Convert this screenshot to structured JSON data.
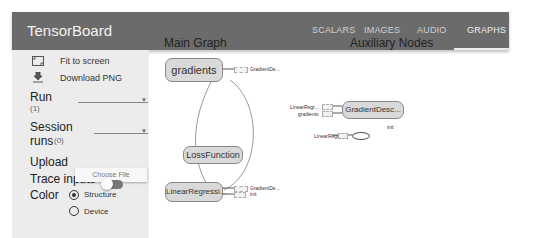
{
  "header": {
    "title": "TensorBoard",
    "tabs": [
      {
        "label": "SCALARS",
        "active": false
      },
      {
        "label": "IMAGES",
        "active": false
      },
      {
        "label": "AUDIO",
        "active": false
      },
      {
        "label": "GRAPHS",
        "active": true
      }
    ]
  },
  "sidebar": {
    "fit_to_screen": "Fit to screen",
    "download_png": "Download PNG",
    "run_label": "Run",
    "run_count": "(1)",
    "session_label": "Session",
    "session_runs_label": "runs",
    "session_runs_count": "(0)",
    "upload_label": "Upload",
    "choose_file": "Choose File",
    "trace_inputs_label": "Trace inputs",
    "trace_inputs_on": false,
    "color_label": "Color",
    "color_options": [
      {
        "label": "Structure",
        "selected": true
      },
      {
        "label": "Device",
        "selected": false
      }
    ]
  },
  "main_graph": {
    "title": "Main Graph",
    "nodes": [
      {
        "label": "gradients",
        "output": "GradientDe..."
      },
      {
        "label": "LossFunction"
      },
      {
        "label": "LinearRegressi...",
        "outputs": [
          "GradientDe...",
          "init"
        ]
      }
    ]
  },
  "auxiliary": {
    "title": "Auxiliary Nodes",
    "gradient_node": {
      "label": "GradientDesc...",
      "inputs": [
        "LinearRegr...",
        "gradients"
      ]
    },
    "init_node": {
      "label": "init",
      "input": "LinearRegr..."
    }
  }
}
